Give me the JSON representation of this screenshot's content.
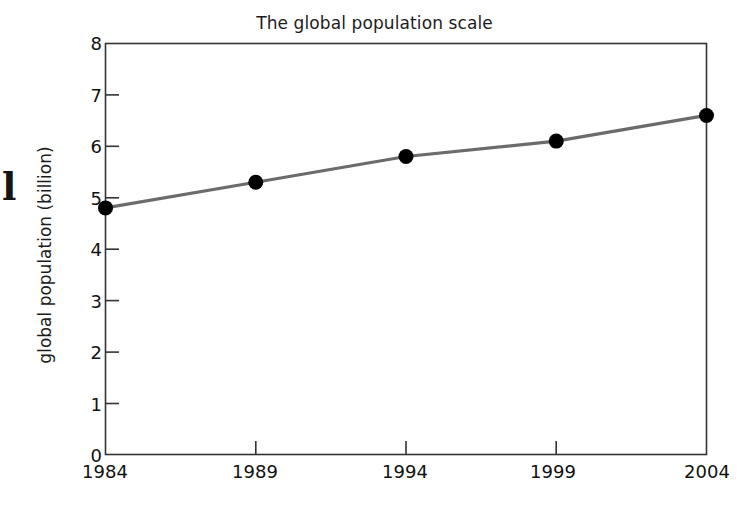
{
  "margin_text": "l",
  "chart_data": {
    "type": "line",
    "title": "The global population scale",
    "xlabel": "",
    "ylabel": "global population (billion)",
    "categories": [
      "1984",
      "1989",
      "1994",
      "1999",
      "2004"
    ],
    "x": [
      1984,
      1989,
      1994,
      1999,
      2004
    ],
    "values": [
      4.8,
      5.3,
      5.8,
      6.1,
      6.6
    ],
    "series": [
      {
        "name": "global population",
        "values": [
          4.8,
          5.3,
          5.8,
          6.1,
          6.6
        ]
      }
    ],
    "xlim": [
      1984,
      2004
    ],
    "ylim": [
      0,
      8
    ],
    "y_ticks": [
      "0",
      "1",
      "2",
      "3",
      "4",
      "5",
      "6",
      "7",
      "8"
    ],
    "x_ticks": [
      "1984",
      "1989",
      "1994",
      "1999",
      "2004"
    ],
    "grid": false,
    "legend": false,
    "legend_position": "none",
    "line_color": "#6b6b6b",
    "marker_color": "#000000",
    "marker_shape": "circle",
    "axis_color": "#333333",
    "background_color": "#ffffff"
  }
}
